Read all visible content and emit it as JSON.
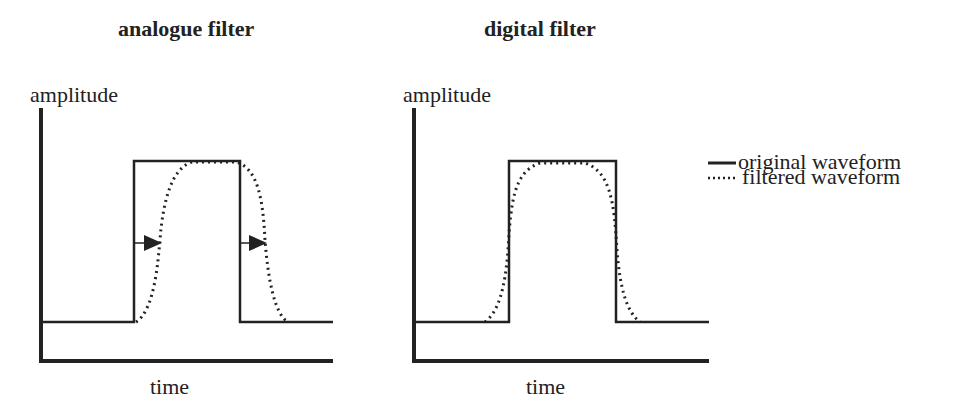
{
  "panels": [
    {
      "title": "analogue filter",
      "y_label": "amplitude",
      "x_label": "time",
      "annotation": "arrows indicate time delay of filtered waveform"
    },
    {
      "title": "digital filter",
      "y_label": "amplitude",
      "x_label": "time"
    }
  ],
  "legend": {
    "items": [
      {
        "label": "original waveform",
        "style": "solid"
      },
      {
        "label": "filtered waveform",
        "style": "dotted"
      }
    ]
  },
  "colors": {
    "line": "#222222",
    "background": "#ffffff"
  }
}
